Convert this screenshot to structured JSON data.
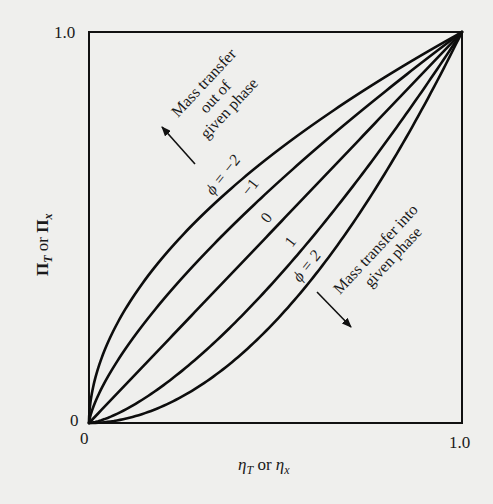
{
  "chart_data": {
    "type": "line",
    "title": "",
    "xlabel": "η_T or η_x",
    "ylabel": "Π_T or Π_x",
    "xlim": [
      0,
      1.0
    ],
    "ylim": [
      0,
      1.0
    ],
    "x_ticks": [
      "0",
      "1.0"
    ],
    "y_ticks": [
      "0",
      "1.0"
    ],
    "grid": false,
    "series": [
      {
        "name": "φ = −2",
        "label": "φ = −2",
        "exponent": 0.53,
        "eta_at_half": 0.27
      },
      {
        "name": "φ = −1",
        "label": "−1",
        "exponent": 0.715,
        "eta_at_half": 0.38
      },
      {
        "name": "φ = 0",
        "label": "0",
        "exponent": 1.0,
        "eta_at_half": 0.5
      },
      {
        "name": "φ = 1",
        "label": "1",
        "exponent": 1.45,
        "eta_at_half": 0.62
      },
      {
        "name": "φ = 2",
        "label": "φ = 2",
        "exponent": 1.94,
        "eta_at_half": 0.7
      }
    ],
    "annotations": [
      {
        "text": [
          "Mass transfer",
          "out of",
          "given phase"
        ],
        "arrow": "up-left"
      },
      {
        "text": [
          "Mass transfer into",
          "given phase"
        ],
        "arrow": "down-right"
      }
    ]
  },
  "axes": {
    "x_label_main": "η",
    "x_label_sub1": "T",
    "x_label_or": " or ",
    "x_label_main2": "η",
    "x_label_sub2": "x",
    "y_label_main": "Π",
    "y_label_sub1": "T",
    "y_label_or": " or ",
    "y_label_main2": "Π",
    "y_label_sub2": "x",
    "x_tick_0": "0",
    "x_tick_1": "1.0",
    "y_tick_0": "0",
    "y_tick_1": "1.0"
  },
  "labels": {
    "phi_m2": "ϕ = −2",
    "m1": "−1",
    "zero": "0",
    "one": "1",
    "phi_2": "ϕ = 2",
    "out_line1": "Mass transfer",
    "out_line2": "out of",
    "out_line3": "given phase",
    "into_line1": "Mass transfer into",
    "into_line2": "given phase"
  }
}
